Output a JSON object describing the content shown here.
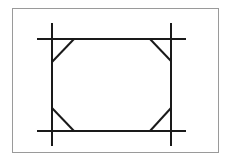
{
  "diagram": {
    "frame_color": "#9a9a9a",
    "stroke_color": "#1a1a1a",
    "stroke_width": 2,
    "shape": "octagon-frame-with-extended-lines",
    "horizontal_lines": [
      {
        "x1": 37,
        "y": 39,
        "x2": 186
      },
      {
        "x1": 37,
        "y": 131,
        "x2": 186
      }
    ],
    "vertical_lines": [
      {
        "x": 52,
        "y1": 23,
        "y2": 146
      },
      {
        "x": 171,
        "y1": 23,
        "y2": 146
      }
    ],
    "corner_diagonals": [
      {
        "x1": 74,
        "y1": 39,
        "x2": 52,
        "y2": 62
      },
      {
        "x1": 150,
        "y1": 39,
        "x2": 171,
        "y2": 61
      },
      {
        "x1": 52,
        "y1": 108,
        "x2": 74,
        "y2": 131
      },
      {
        "x1": 171,
        "y1": 108,
        "x2": 150,
        "y2": 131
      }
    ]
  }
}
